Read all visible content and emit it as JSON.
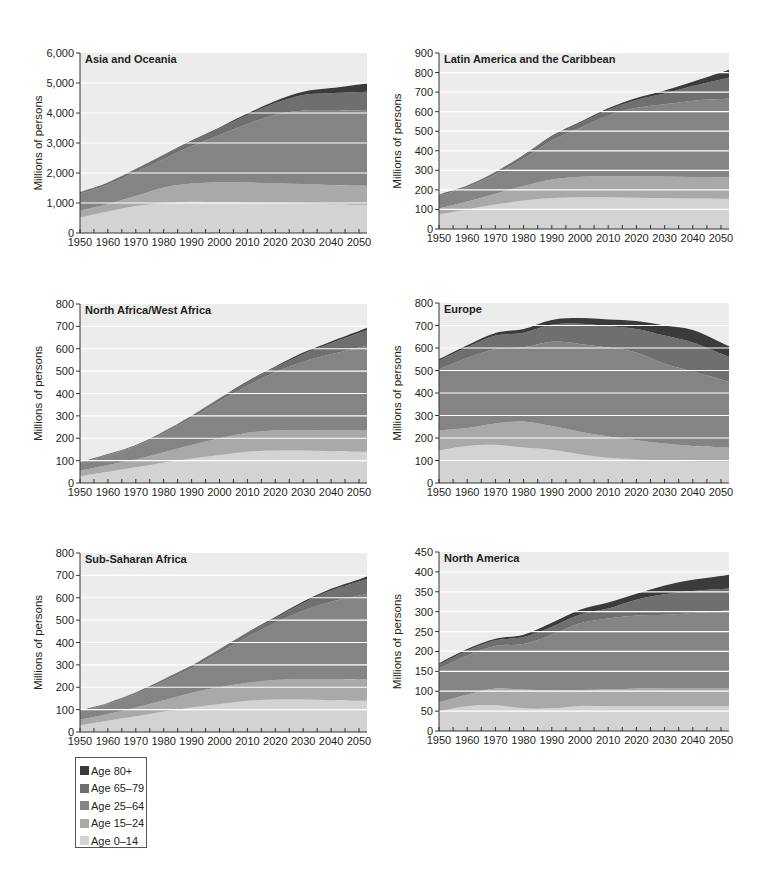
{
  "legend": {
    "items": [
      {
        "label": "Age 80+",
        "color": "#3b3b3b"
      },
      {
        "label": "Age 65–79",
        "color": "#6f6f6f"
      },
      {
        "label": "Age 25–64",
        "color": "#848484"
      },
      {
        "label": "Age 15–24",
        "color": "#a9a9a9"
      },
      {
        "label": "Age 0–14",
        "color": "#d3d3d3"
      }
    ]
  },
  "colors": {
    "background": "#ececec",
    "gridline": "#ffffff",
    "age_0_14": "#d3d3d3",
    "age_15_24": "#a9a9a9",
    "age_25_64": "#848484",
    "age_65_79": "#6f6f6f",
    "age_80_plus": "#3b3b3b"
  },
  "chart_data": [
    {
      "type": "area",
      "stacked": true,
      "title": "Asia and Oceania",
      "xlabel": "",
      "ylabel": "Millions of persons",
      "ylim": [
        0,
        6000
      ],
      "yticks": [
        "0",
        "1,000",
        "2,000",
        "3,000",
        "4,000",
        "5,000",
        "6,000"
      ],
      "xticks": [
        "1950",
        "1960",
        "1970",
        "1980",
        "1990",
        "2000",
        "2010",
        "2020",
        "2030",
        "2040",
        "2050"
      ],
      "x": [
        1950,
        1960,
        1970,
        1980,
        1990,
        2000,
        2010,
        2020,
        2030,
        2040,
        2050
      ],
      "series": [
        {
          "name": "Age 0–14",
          "values": [
            520,
            720,
            900,
            1000,
            1040,
            1030,
            1020,
            1010,
            990,
            960,
            940
          ]
        },
        {
          "name": "Age 15–24",
          "values": [
            230,
            250,
            330,
            520,
            610,
            660,
            660,
            650,
            640,
            640,
            640
          ]
        },
        {
          "name": "Age 25–64",
          "values": [
            560,
            640,
            800,
            950,
            1250,
            1580,
            1950,
            2280,
            2450,
            2500,
            2500
          ]
        },
        {
          "name": "Age 65–79",
          "values": [
            50,
            70,
            90,
            120,
            160,
            220,
            300,
            390,
            520,
            560,
            620
          ]
        },
        {
          "name": "Age 80+",
          "values": [
            5,
            8,
            10,
            15,
            20,
            30,
            50,
            70,
            110,
            170,
            250
          ]
        }
      ],
      "grid": true,
      "legend_position": "bottom-left"
    },
    {
      "type": "area",
      "stacked": true,
      "title": "Latin America and the Caribbean",
      "xlabel": "",
      "ylabel": "Millions of persons",
      "ylim": [
        0,
        900
      ],
      "yticks": [
        "0",
        "100",
        "200",
        "300",
        "400",
        "500",
        "600",
        "700",
        "800",
        "900"
      ],
      "xticks": [
        "1950",
        "1960",
        "1970",
        "1980",
        "1990",
        "2000",
        "2010",
        "2020",
        "2030",
        "2040",
        "2050"
      ],
      "x": [
        1950,
        1960,
        1970,
        1980,
        1990,
        2000,
        2010,
        2020,
        2030,
        2040,
        2050
      ],
      "series": [
        {
          "name": "Age 0–14",
          "values": [
            75,
            100,
            125,
            145,
            158,
            162,
            162,
            160,
            158,
            156,
            155
          ]
        },
        {
          "name": "Age 15–24",
          "values": [
            30,
            40,
            55,
            75,
            95,
            105,
            108,
            110,
            110,
            110,
            110
          ]
        },
        {
          "name": "Age 25–64",
          "values": [
            65,
            75,
            100,
            140,
            200,
            250,
            310,
            350,
            370,
            390,
            400
          ]
        },
        {
          "name": "Age 65–79",
          "values": [
            5,
            7,
            10,
            15,
            20,
            25,
            30,
            40,
            55,
            75,
            100
          ]
        },
        {
          "name": "Age 80+",
          "values": [
            1,
            1,
            2,
            3,
            4,
            5,
            7,
            10,
            15,
            22,
            35
          ]
        }
      ],
      "grid": true
    },
    {
      "type": "area",
      "stacked": true,
      "title": "North Africa/West Africa",
      "xlabel": "",
      "ylabel": "Millions of persons",
      "ylim": [
        0,
        800
      ],
      "yticks": [
        "0",
        "100",
        "200",
        "300",
        "400",
        "500",
        "600",
        "700",
        "800"
      ],
      "xticks": [
        "1950",
        "1960",
        "1970",
        "1980",
        "1990",
        "2000",
        "2010",
        "2020",
        "2030",
        "2040",
        "2050"
      ],
      "x": [
        1950,
        1960,
        1970,
        1980,
        1990,
        2000,
        2010,
        2020,
        2030,
        2040,
        2050
      ],
      "series": [
        {
          "name": "Age 0–14",
          "values": [
            30,
            50,
            70,
            92,
            110,
            125,
            140,
            145,
            145,
            142,
            140
          ]
        },
        {
          "name": "Age 15–24",
          "values": [
            25,
            30,
            35,
            45,
            60,
            75,
            85,
            90,
            92,
            93,
            95
          ]
        },
        {
          "name": "Age 25–64",
          "values": [
            35,
            45,
            60,
            85,
            120,
            165,
            210,
            260,
            305,
            340,
            370
          ]
        },
        {
          "name": "Age 65–79",
          "values": [
            3,
            4,
            5,
            7,
            10,
            12,
            17,
            22,
            35,
            50,
            65
          ]
        },
        {
          "name": "Age 80+",
          "values": [
            0,
            0,
            0,
            1,
            1,
            2,
            3,
            4,
            6,
            8,
            10
          ]
        }
      ],
      "grid": true
    },
    {
      "type": "area",
      "stacked": true,
      "title": "Europe",
      "xlabel": "",
      "ylabel": "Millions of persons",
      "ylim": [
        0,
        800
      ],
      "yticks": [
        "0",
        "100",
        "200",
        "300",
        "400",
        "500",
        "600",
        "700",
        "800"
      ],
      "xticks": [
        "1950",
        "1960",
        "1970",
        "1980",
        "1990",
        "2000",
        "2010",
        "2020",
        "2030",
        "2040",
        "2050"
      ],
      "x": [
        1950,
        1960,
        1970,
        1980,
        1990,
        2000,
        2010,
        2020,
        2030,
        2040,
        2050
      ],
      "series": [
        {
          "name": "Age 0–14",
          "values": [
            145,
            165,
            170,
            158,
            148,
            128,
            112,
            105,
            100,
            97,
            95
          ]
        },
        {
          "name": "Age 15–24",
          "values": [
            90,
            80,
            95,
            115,
            105,
            100,
            95,
            85,
            75,
            68,
            65
          ]
        },
        {
          "name": "Age 25–64",
          "values": [
            270,
            310,
            330,
            330,
            375,
            390,
            395,
            390,
            355,
            330,
            300
          ]
        },
        {
          "name": "Age 65–79",
          "values": [
            38,
            48,
            60,
            65,
            75,
            90,
            95,
            105,
            125,
            130,
            115
          ]
        },
        {
          "name": "Age 80+",
          "values": [
            7,
            9,
            12,
            17,
            22,
            25,
            30,
            35,
            45,
            55,
            50
          ]
        }
      ],
      "grid": true
    },
    {
      "type": "area",
      "stacked": true,
      "title": "Sub-Saharan Africa",
      "xlabel": "",
      "ylabel": "Millions of persons",
      "ylim": [
        0,
        800
      ],
      "yticks": [
        "0",
        "100",
        "200",
        "300",
        "400",
        "500",
        "600",
        "700",
        "800"
      ],
      "xticks": [
        "1950",
        "1960",
        "1970",
        "1980",
        "1990",
        "2000",
        "2010",
        "2020",
        "2030",
        "2040",
        "2050"
      ],
      "x": [
        1950,
        1960,
        1970,
        1980,
        1990,
        2000,
        2010,
        2020,
        2030,
        2040,
        2050
      ],
      "series": [
        {
          "name": "Age 0–14",
          "values": [
            30,
            50,
            70,
            92,
            110,
            125,
            140,
            145,
            145,
            142,
            140
          ]
        },
        {
          "name": "Age 15–24",
          "values": [
            25,
            30,
            40,
            50,
            65,
            75,
            80,
            88,
            92,
            95,
            95
          ]
        },
        {
          "name": "Age 25–64",
          "values": [
            38,
            45,
            60,
            85,
            110,
            155,
            205,
            255,
            305,
            345,
            375
          ]
        },
        {
          "name": "Age 65–79",
          "values": [
            4,
            5,
            6,
            8,
            10,
            13,
            17,
            22,
            35,
            50,
            62
          ]
        },
        {
          "name": "Age 80+",
          "values": [
            0,
            0,
            1,
            1,
            2,
            2,
            3,
            4,
            6,
            8,
            10
          ]
        }
      ],
      "grid": true
    },
    {
      "type": "area",
      "stacked": true,
      "title": "North America",
      "xlabel": "",
      "ylabel": "Millions of persons",
      "ylim": [
        0,
        450
      ],
      "yticks": [
        "0",
        "50",
        "100",
        "150",
        "200",
        "250",
        "300",
        "350",
        "400",
        "450"
      ],
      "xticks": [
        "1950",
        "1960",
        "1970",
        "1980",
        "1990",
        "2000",
        "2010",
        "2020",
        "2030",
        "2040",
        "2050"
      ],
      "x": [
        1950,
        1960,
        1970,
        1980,
        1990,
        2000,
        2010,
        2020,
        2030,
        2040,
        2050
      ],
      "series": [
        {
          "name": "Age 0–14",
          "values": [
            50,
            62,
            65,
            57,
            57,
            63,
            62,
            62,
            62,
            62,
            62
          ]
        },
        {
          "name": "Age 15–24",
          "values": [
            22,
            30,
            42,
            47,
            45,
            40,
            43,
            45,
            45,
            45,
            45
          ]
        },
        {
          "name": "Age 25–64",
          "values": [
            85,
            98,
            107,
            115,
            140,
            168,
            178,
            183,
            185,
            190,
            195
          ]
        },
        {
          "name": "Age 65–79",
          "values": [
            10,
            12,
            14,
            17,
            20,
            22,
            25,
            40,
            52,
            55,
            55
          ]
        },
        {
          "name": "Age 80+",
          "values": [
            3,
            4,
            4,
            6,
            10,
            12,
            15,
            15,
            22,
            28,
            33
          ]
        }
      ],
      "grid": true
    }
  ]
}
